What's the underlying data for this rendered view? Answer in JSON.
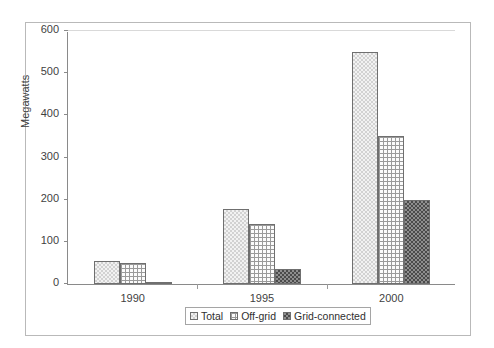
{
  "chart_data": {
    "type": "bar",
    "title": "",
    "xlabel": "",
    "ylabel": "Megawatts",
    "categories": [
      "1990",
      "1995",
      "2000"
    ],
    "series": [
      {
        "name": "Total",
        "values": [
          55,
          178,
          550
        ]
      },
      {
        "name": "Off-grid",
        "values": [
          50,
          142,
          350
        ]
      },
      {
        "name": "Grid-connected",
        "values": [
          3,
          35,
          200
        ]
      }
    ],
    "ylim": [
      0,
      600
    ],
    "yticks": [
      0,
      100,
      200,
      300,
      400,
      500,
      600
    ],
    "ytick_labels": [
      "0",
      "100",
      "200",
      "300",
      "400",
      "500",
      "600"
    ],
    "grid": false,
    "legend_position": "bottom-center",
    "legend_entries": [
      "Total",
      "Off-grid",
      "Grid-connected"
    ]
  },
  "axes": {
    "y_title": "Megawatts"
  },
  "legend": {
    "items": [
      {
        "label": "Total",
        "swatch": "light-dotted-swatch"
      },
      {
        "label": "Off-grid",
        "swatch": "cross-hatch-swatch"
      },
      {
        "label": "Grid-connected",
        "swatch": "dark-checker-swatch"
      }
    ]
  }
}
